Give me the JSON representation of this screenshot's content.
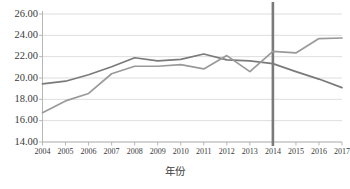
{
  "chart_data": {
    "type": "line",
    "title": "",
    "subtitle": "",
    "xlabel": "年份",
    "ylabel": "",
    "categories": [
      "2004",
      "2005",
      "2006",
      "2007",
      "2008",
      "2009",
      "2010",
      "2011",
      "2012",
      "2013",
      "2014",
      "2015",
      "2016",
      "2017"
    ],
    "x": [
      2004,
      2005,
      2006,
      2007,
      2008,
      2009,
      2010,
      2011,
      2012,
      2013,
      2014,
      2015,
      2016,
      2017
    ],
    "series": [
      {
        "name": "series-dark",
        "color": "#7a7a7a",
        "values": [
          19.45,
          19.7,
          20.3,
          21.05,
          21.9,
          21.6,
          21.75,
          22.25,
          21.7,
          21.6,
          21.35,
          20.6,
          19.9,
          19.1
        ]
      },
      {
        "name": "series-light",
        "color": "#9a9a9a",
        "values": [
          16.75,
          17.85,
          18.55,
          20.4,
          21.1,
          21.1,
          21.25,
          20.85,
          22.1,
          20.6,
          22.5,
          22.35,
          23.7,
          23.75
        ]
      }
    ],
    "ylim": [
      14.0,
      26.0
    ],
    "ytick_step": 2.0,
    "ytick_labels": [
      "26.00",
      "24.00",
      "22.00",
      "20.00",
      "18.00",
      "16.00",
      "14.00"
    ],
    "ytick_values": [
      26.0,
      24.0,
      22.0,
      20.0,
      18.0,
      16.0,
      14.0
    ],
    "grid": true,
    "grid_color": "#d4d4d4",
    "legend": "none",
    "annotations": [
      {
        "name": "vertical-marker-2014",
        "type": "vline",
        "x": 2014,
        "color": "#7a7a7a",
        "label": ""
      }
    ],
    "axis_color": "#b0b0b0",
    "background": "#ffffff"
  }
}
